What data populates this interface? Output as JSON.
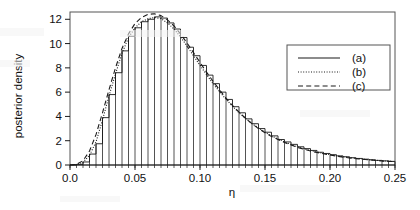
{
  "chart_data": {
    "type": "bar",
    "title": "",
    "subtitle": "",
    "xlabel": "η",
    "ylabel": "posterior density",
    "xlim": [
      0.0,
      0.25
    ],
    "ylim": [
      0.0,
      12.6
    ],
    "grid": false,
    "legend_position": "right-top",
    "x_ticks": [
      0.0,
      0.05,
      0.1,
      0.15,
      0.2,
      0.25
    ],
    "x_tick_labels": [
      "0.0",
      "0.05",
      "0.10",
      "0.15",
      "0.20",
      "0.25"
    ],
    "y_ticks": [
      0,
      2,
      4,
      6,
      8,
      10,
      12
    ],
    "y_tick_labels": [
      "0",
      "2",
      "4",
      "6",
      "8",
      "10",
      "12"
    ],
    "x_minor_tick_step": 0.005,
    "bin_width": 0.005,
    "legend": [
      {
        "key": "a",
        "label": "(a)",
        "style": "solid",
        "desc": "histogram of posterior sample"
      },
      {
        "key": "b",
        "label": "(b)",
        "style": "dotted",
        "desc": "smoothed density estimate"
      },
      {
        "key": "c",
        "label": "(c)",
        "style": "dashed",
        "desc": "analytic approximation"
      }
    ],
    "series": [
      {
        "name": "(a)",
        "style": "solid",
        "type": "histogram",
        "bin_edges": [
          0.0,
          0.005,
          0.01,
          0.015,
          0.02,
          0.025,
          0.03,
          0.035,
          0.04,
          0.045,
          0.05,
          0.055,
          0.06,
          0.065,
          0.07,
          0.075,
          0.08,
          0.085,
          0.09,
          0.095,
          0.1,
          0.105,
          0.11,
          0.115,
          0.12,
          0.125,
          0.13,
          0.135,
          0.14,
          0.145,
          0.15,
          0.155,
          0.16,
          0.165,
          0.17,
          0.175,
          0.18,
          0.185,
          0.19,
          0.195,
          0.2,
          0.205,
          0.21,
          0.215,
          0.22,
          0.225,
          0.23,
          0.235,
          0.24,
          0.245,
          0.25
        ],
        "values": [
          0.0,
          0.05,
          0.25,
          0.9,
          1.75,
          3.9,
          5.8,
          7.6,
          9.4,
          10.6,
          11.3,
          11.8,
          12.0,
          12.2,
          12.1,
          11.7,
          11.2,
          10.5,
          9.7,
          9.0,
          8.2,
          7.4,
          6.7,
          6.0,
          5.4,
          4.8,
          4.3,
          3.8,
          3.4,
          3.0,
          2.7,
          2.4,
          2.1,
          1.9,
          1.7,
          1.5,
          1.35,
          1.2,
          1.05,
          0.95,
          0.85,
          0.75,
          0.68,
          0.6,
          0.54,
          0.48,
          0.43,
          0.38,
          0.34,
          0.3
        ]
      },
      {
        "name": "(b)",
        "style": "dotted",
        "type": "line",
        "x": [
          0.0,
          0.005,
          0.01,
          0.015,
          0.02,
          0.025,
          0.03,
          0.035,
          0.04,
          0.045,
          0.05,
          0.055,
          0.06,
          0.065,
          0.07,
          0.075,
          0.08,
          0.085,
          0.09,
          0.095,
          0.1,
          0.105,
          0.11,
          0.115,
          0.12,
          0.125,
          0.13,
          0.135,
          0.14,
          0.145,
          0.15,
          0.155,
          0.16,
          0.165,
          0.17,
          0.175,
          0.18,
          0.185,
          0.19,
          0.195,
          0.2,
          0.205,
          0.21,
          0.215,
          0.22,
          0.225,
          0.23,
          0.235,
          0.24,
          0.245,
          0.25
        ],
        "values": [
          0.0,
          0.04,
          0.22,
          0.8,
          1.9,
          3.7,
          5.7,
          7.5,
          9.2,
          10.5,
          11.3,
          11.8,
          12.05,
          12.15,
          12.05,
          11.7,
          11.2,
          10.55,
          9.8,
          9.0,
          8.2,
          7.45,
          6.7,
          6.05,
          5.4,
          4.85,
          4.3,
          3.85,
          3.4,
          3.05,
          2.7,
          2.4,
          2.15,
          1.9,
          1.7,
          1.5,
          1.35,
          1.2,
          1.07,
          0.95,
          0.85,
          0.76,
          0.68,
          0.61,
          0.54,
          0.49,
          0.43,
          0.39,
          0.35,
          0.31,
          0.28
        ]
      },
      {
        "name": "(c)",
        "style": "dashed",
        "type": "line",
        "x": [
          0.0,
          0.005,
          0.01,
          0.015,
          0.02,
          0.025,
          0.03,
          0.035,
          0.04,
          0.045,
          0.05,
          0.055,
          0.06,
          0.065,
          0.07,
          0.075,
          0.08,
          0.085,
          0.09,
          0.095,
          0.1,
          0.105,
          0.11,
          0.115,
          0.12,
          0.125,
          0.13,
          0.135,
          0.14,
          0.145,
          0.15,
          0.155,
          0.16,
          0.165,
          0.17,
          0.175,
          0.18,
          0.185,
          0.19,
          0.195,
          0.2,
          0.205,
          0.21,
          0.215,
          0.22,
          0.225,
          0.23,
          0.235,
          0.24,
          0.245,
          0.25
        ],
        "values": [
          0.0,
          0.05,
          0.35,
          1.15,
          2.5,
          4.3,
          6.2,
          8.0,
          9.6,
          10.8,
          11.65,
          12.15,
          12.4,
          12.45,
          12.3,
          11.95,
          11.45,
          10.8,
          10.05,
          9.25,
          8.45,
          7.65,
          6.9,
          6.2,
          5.5,
          4.9,
          4.35,
          3.85,
          3.4,
          3.0,
          2.65,
          2.35,
          2.1,
          1.85,
          1.65,
          1.45,
          1.3,
          1.15,
          1.03,
          0.92,
          0.82,
          0.73,
          0.65,
          0.58,
          0.52,
          0.47,
          0.42,
          0.37,
          0.33,
          0.3,
          0.27
        ]
      }
    ]
  },
  "axes": {
    "x_title": "η",
    "y_title": "posterior density"
  },
  "colors": {
    "line": "#1a1a1a",
    "frame": "#555555",
    "background": "#ffffff"
  }
}
